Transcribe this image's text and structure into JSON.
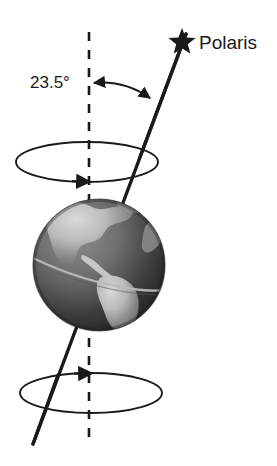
{
  "diagram": {
    "labels": {
      "polaris": "Polaris",
      "tilt_angle": "23.5°"
    },
    "icons": {
      "star": "star-icon",
      "earth": "earth-globe-icon"
    },
    "colors": {
      "background": "#ffffff",
      "line": "#1a1a1a",
      "text": "#1a1a1a",
      "ocean_dark": "#2b2b2b",
      "ocean_mid": "#4f4f4f",
      "land_light": "#c9c9c9",
      "land_mid": "#9a9a9a",
      "highlight": "#e6e6e6"
    },
    "geometry": {
      "tilt_degrees": 23.5,
      "vertical_axis": {
        "x": 89,
        "y_top": 32,
        "y_bottom": 446,
        "style": "dashed"
      },
      "tilt_axis": {
        "x_top": 186,
        "y_top": 34,
        "x_bottom": 33,
        "y_bottom": 444,
        "style": "solid"
      },
      "star": {
        "cx": 182,
        "cy": 41,
        "r": 11
      },
      "globe": {
        "cx": 99,
        "cy": 265,
        "r": 66
      },
      "upper_precession_circle": {
        "cx": 87,
        "cy": 162,
        "rx": 71,
        "ry": 20
      },
      "lower_precession_circle": {
        "cx": 91,
        "cy": 393,
        "rx": 71,
        "ry": 20
      },
      "angle_arc": {
        "from_x": 94,
        "from_y": 83,
        "to_x": 150,
        "to_y": 98,
        "double_headed": true
      }
    }
  }
}
